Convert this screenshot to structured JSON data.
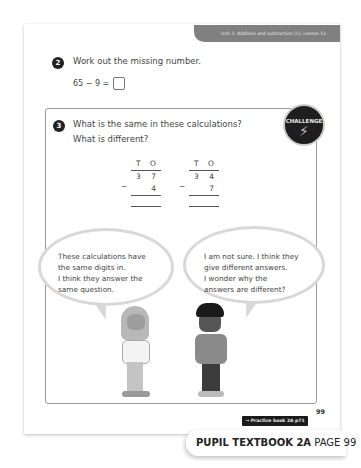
{
  "header": {
    "unit_label": "Unit 2: Addition and subtraction (1), Lesson 12"
  },
  "question2": {
    "number": "2",
    "prompt": "Work out the missing number.",
    "equation": "65 − 9 ="
  },
  "question3": {
    "number": "3",
    "prompt_line1": "What is the same in these calculations?",
    "prompt_line2": "What is different?",
    "badge": "CHALLENGE",
    "calculations": [
      {
        "headers": [
          "T",
          "O"
        ],
        "top": [
          "3",
          "7"
        ],
        "operator": "−",
        "bottom": [
          "",
          "4"
        ]
      },
      {
        "headers": [
          "T",
          "O"
        ],
        "top": [
          "3",
          "4"
        ],
        "operator": "−",
        "bottom": [
          "",
          "7"
        ]
      }
    ],
    "speech": [
      {
        "lines": [
          "These calculations have",
          "the same digits in.",
          "I think they answer the",
          "same question."
        ]
      },
      {
        "lines": [
          "I am not sure. I think they",
          "give different answers.",
          "I wonder why the",
          "answers are different?"
        ]
      }
    ]
  },
  "footer": {
    "page_number": "99",
    "practice_link": "→ Practice book 2A p71",
    "book_title": "PUPIL TEXTBOOK 2A",
    "page_label": "PAGE 99"
  }
}
